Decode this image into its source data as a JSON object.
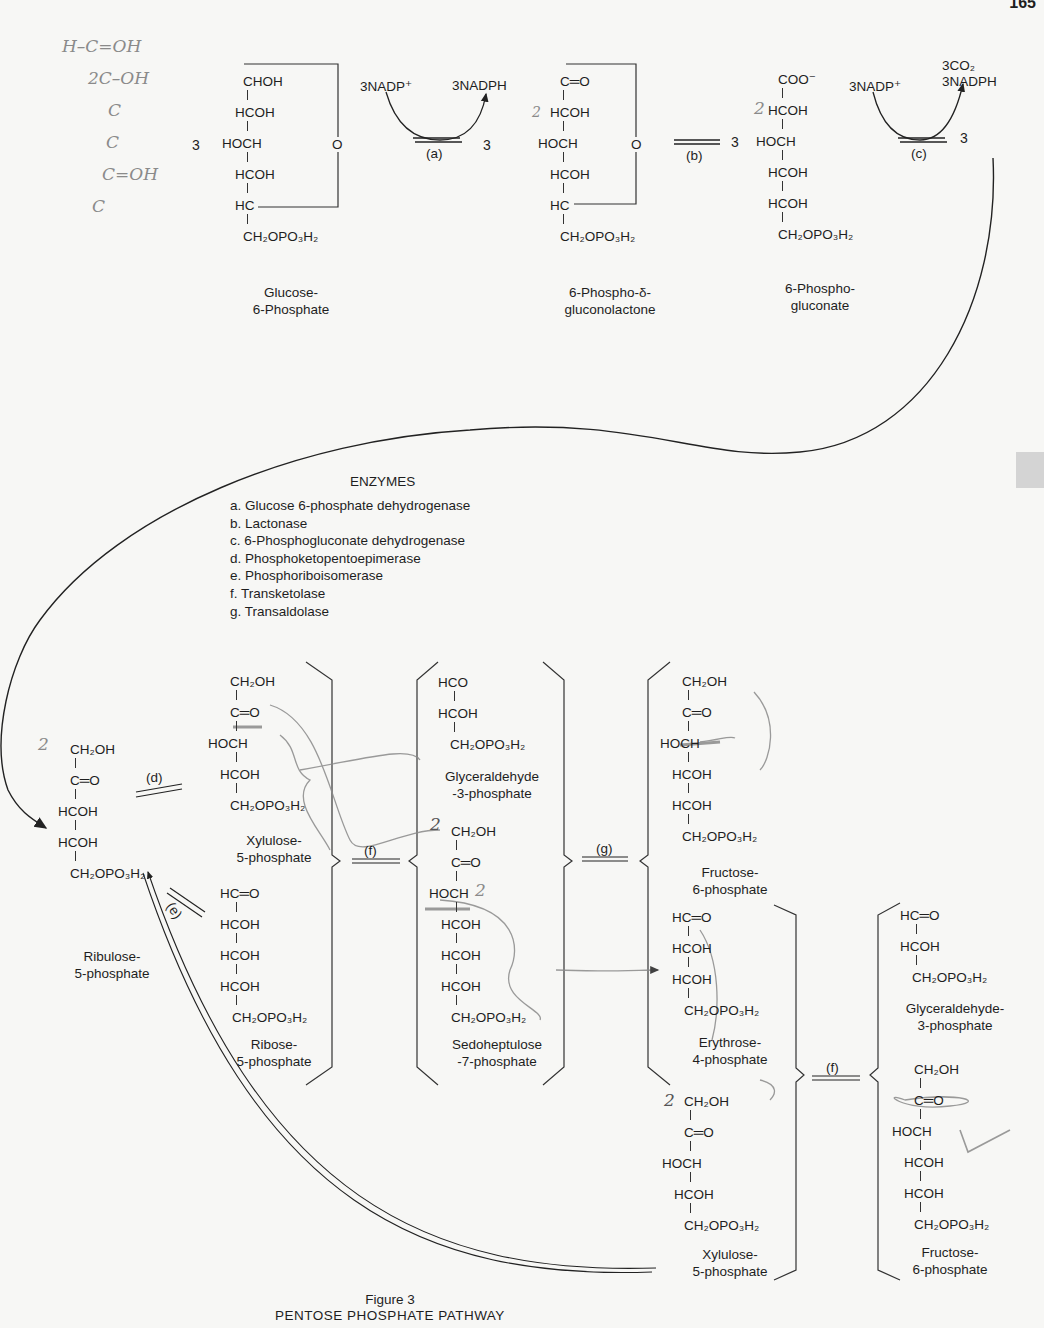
{
  "figure": {
    "page_number": "165",
    "caption_title": "Figure 3",
    "caption_subtitle": "PENTOSE PHOSPHATE PATHWAY"
  },
  "top_row": {
    "glucose_6_phosphate": {
      "coefficient": "3",
      "atoms": [
        "CHOH",
        "HCOH",
        "HOCH",
        "HCOH",
        "HC",
        "CH₂OPO₃H₂"
      ],
      "ring_oxygen": "O",
      "name_line1": "Glucose-",
      "name_line2": "6-Phosphate"
    },
    "reaction_a": {
      "cofactor_in": "3NADP⁺",
      "cofactor_out": "3NADPH",
      "enzyme": "(a)",
      "product_coefficient": "3"
    },
    "phosphogluconolactone": {
      "atoms": [
        "C═O",
        "HCOH",
        "HOCH",
        "HCOH",
        "HC",
        "CH₂OPO₃H₂"
      ],
      "ring_oxygen": "O",
      "name_line1": "6-Phospho-δ-",
      "name_line2": "gluconolactone"
    },
    "reaction_b": {
      "enzyme": "(b)",
      "product_coefficient": "3"
    },
    "phosphogluconate": {
      "atoms": [
        "COO⁻",
        "HCOH",
        "HOCH",
        "HCOH",
        "HCOH",
        "CH₂OPO₃H₂"
      ],
      "name_line1": "6-Phospho-",
      "name_line2": "gluconate"
    },
    "reaction_c": {
      "cofactor_in": "3NADP⁺",
      "cofactor_out_1": "3CO₂",
      "cofactor_out_2": "3NADPH",
      "enzyme": "(c)",
      "product_coefficient": "3"
    }
  },
  "enzymes": {
    "title": "ENZYMES",
    "items": [
      "a. Glucose 6-phosphate dehydrogenase",
      "b. Lactonase",
      "c. 6-Phosphogluconate dehydrogenase",
      "d. Phosphoketopentoepimerase",
      "e. Phosphoriboisomerase",
      "f. Transketolase",
      "g. Transaldolase"
    ]
  },
  "bottom": {
    "ribulose_5_phosphate": {
      "atoms": [
        "CH₂OH",
        "C═O",
        "HCOH",
        "HCOH",
        "CH₂OPO₃H₂"
      ],
      "name_line1": "Ribulose-",
      "name_line2": "5-phosphate"
    },
    "reaction_d": {
      "enzyme": "(d)"
    },
    "reaction_e": {
      "enzyme": "(e)"
    },
    "xylulose_5_phosphate_1": {
      "atoms": [
        "CH₂OH",
        "C═O",
        "HOCH",
        "HCOH",
        "CH₂OPO₃H₂"
      ],
      "name_line1": "Xylulose-",
      "name_line2": "5-phosphate"
    },
    "ribose_5_phosphate": {
      "atoms": [
        "HC═O",
        "HCOH",
        "HCOH",
        "HCOH",
        "CH₂OPO₃H₂"
      ],
      "name_line1": "Ribose-",
      "name_line2": "5-phosphate"
    },
    "reaction_f1": {
      "enzyme": "(f)"
    },
    "glyceraldehyde_3_phosphate_1": {
      "atoms": [
        "HCO",
        "HCOH",
        "CH₂OPO₃H₂"
      ],
      "name_line1": "Glyceraldehyde",
      "name_line2": "-3-phosphate"
    },
    "sedoheptulose_7_phosphate": {
      "atoms": [
        "CH₂OH",
        "C═O",
        "HOCH",
        "HCOH",
        "HCOH",
        "HCOH",
        "CH₂OPO₃H₂"
      ],
      "name_line1": "Sedoheptulose",
      "name_line2": "-7-phosphate"
    },
    "reaction_g": {
      "enzyme": "(g)"
    },
    "fructose_6_phosphate_1": {
      "atoms": [
        "CH₂OH",
        "C═O",
        "HOCH",
        "HCOH",
        "HCOH",
        "CH₂OPO₃H₂"
      ],
      "name_line1": "Fructose-",
      "name_line2": "6-phosphate"
    },
    "erythrose_4_phosphate": {
      "atoms": [
        "HC═O",
        "HCOH",
        "HCOH",
        "CH₂OPO₃H₂"
      ],
      "name_line1": "Erythrose-",
      "name_line2": "4-phosphate"
    },
    "xylulose_5_phosphate_2": {
      "atoms": [
        "CH₂OH",
        "C═O",
        "HOCH",
        "HCOH",
        "CH₂OPO₃H₂"
      ],
      "name_line1": "Xylulose-",
      "name_line2": "5-phosphate"
    },
    "reaction_f2": {
      "enzyme": "(f)"
    },
    "glyceraldehyde_3_phosphate_2": {
      "atoms": [
        "HC═O",
        "HCOH",
        "CH₂OPO₃H₂"
      ],
      "name_line1": "Glyceraldehyde-",
      "name_line2": "3-phosphate"
    },
    "fructose_6_phosphate_2": {
      "atoms": [
        "CH₂OH",
        "C═O",
        "HOCH",
        "HCOH",
        "HCOH",
        "CH₂OPO₃H₂"
      ],
      "name_line1": "Fructose-",
      "name_line2": "6-phosphate"
    }
  },
  "handwritten_notes": {
    "margin_structure": [
      "H–C=OH",
      "2C–OH",
      "C",
      "C",
      "C=OH",
      "C"
    ],
    "carbon_marks": "2",
    "checkmark": "✓"
  }
}
